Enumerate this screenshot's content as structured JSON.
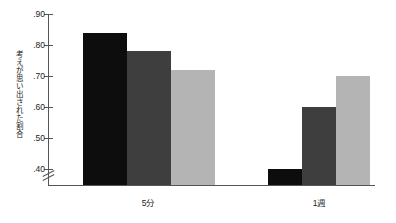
{
  "chart_data": {
    "type": "bar",
    "title": "",
    "subtitle": "",
    "xlabel": "",
    "ylabel": "考えが思い出された割合",
    "categories": [
      "5分",
      "1週"
    ],
    "series": [
      {
        "name": "series-1",
        "color": "#0d0d0d",
        "values": [
          0.84,
          0.4
        ]
      },
      {
        "name": "series-2",
        "color": "#3e3e3e",
        "values": [
          0.78,
          0.6
        ]
      },
      {
        "name": "series-3",
        "color": "#b4b4b4",
        "values": [
          0.72,
          0.7
        ]
      }
    ],
    "ylim": [
      0.35,
      0.9
    ],
    "ytick_values": [
      0.9,
      0.8,
      0.7,
      0.6,
      0.5,
      0.4
    ],
    "ytick_labels": [
      ".90",
      ".80",
      ".70",
      ".60",
      ".50",
      ".40"
    ],
    "grid": false,
    "legend": "none",
    "axis_break": true,
    "axis_break_symbol": "//"
  },
  "axis": {
    "y_label": "考えが思い出された割合",
    "ticks": [
      ".90",
      ".80",
      ".70",
      ".60",
      ".50",
      ".40"
    ]
  },
  "groups": [
    {
      "label": "5分",
      "bars": [
        ".84",
        ".78",
        ".72"
      ]
    },
    {
      "label": "1週",
      "bars": [
        ".40",
        ".60",
        ".70"
      ]
    }
  ]
}
